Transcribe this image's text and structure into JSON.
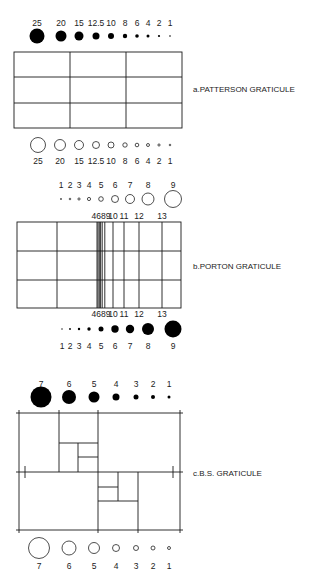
{
  "figure": {
    "patterson": {
      "caption": "a.PATTERSON GRATICULE",
      "filled_circles": {
        "labels": [
          "25",
          "20",
          "15",
          "12.5",
          "10",
          "8",
          "6",
          "4",
          "2",
          "1"
        ],
        "cx": [
          37,
          61,
          79,
          96,
          111,
          125,
          137,
          148,
          159,
          170
        ],
        "r": [
          7.5,
          5.5,
          4.5,
          3.5,
          3,
          2.2,
          1.8,
          1.5,
          1.1,
          0.8
        ],
        "label_y": 23,
        "cy": 36
      },
      "grid": {
        "x0": 14,
        "y0": 52,
        "x1": 182,
        "y1": 128,
        "vlines": [
          70,
          126
        ],
        "hlines": [
          77,
          103
        ]
      },
      "open_circles": {
        "labels": [
          "25",
          "20",
          "15",
          "12.5",
          "10",
          "8",
          "6",
          "4",
          "2",
          "1"
        ],
        "cx": [
          38,
          60,
          79,
          96,
          111,
          125,
          137,
          148,
          159,
          170
        ],
        "r": [
          7.5,
          5.5,
          4.5,
          3.5,
          3,
          2.2,
          1.8,
          1.5,
          1.1,
          0.8
        ],
        "cy": 145,
        "label_y": 161
      }
    },
    "porton": {
      "caption": "b.PORTON  GRATICULE",
      "open_circles": {
        "labels": [
          "1",
          "2",
          "3",
          "4",
          "5",
          "6",
          "7",
          "8",
          "9"
        ],
        "cx": [
          61,
          70,
          79,
          89,
          101,
          115,
          130,
          148,
          173
        ],
        "r": [
          0.6,
          0.8,
          1.1,
          1.6,
          2.3,
          3.5,
          4.5,
          6,
          8.5
        ],
        "label_y": 185,
        "cy": 199
      },
      "grid_labels": [
        "4689",
        "10",
        "11",
        "12",
        "13"
      ],
      "grid_label_x": [
        101,
        113,
        124,
        139,
        162
      ],
      "grid_label_top_y": 219,
      "grid_label_bottom_y": 317,
      "grid": {
        "x0": 17,
        "y0": 222,
        "x1": 181,
        "y1": 308,
        "vlines": [
          57,
          97,
          98,
          99.3,
          100.6,
          102.2,
          104.8,
          113,
          124,
          139,
          162
        ],
        "hlines": [
          251,
          280
        ]
      },
      "filled_circles": {
        "labels": [
          "1",
          "2",
          "3",
          "4",
          "5",
          "6",
          "7",
          "8",
          "9"
        ],
        "cx": [
          62,
          70,
          79,
          89,
          101,
          115,
          130,
          148,
          173
        ],
        "r": [
          0.7,
          0.9,
          1.2,
          1.7,
          2.5,
          3.7,
          4.2,
          6,
          8.5
        ],
        "cy": 329,
        "label_y": 346
      }
    },
    "bs": {
      "caption": "c.B.S. GRATICULE",
      "filled_circles": {
        "labels": [
          "7",
          "6",
          "5",
          "4",
          "3",
          "2",
          "1"
        ],
        "cx": [
          41,
          69,
          94,
          116,
          136,
          153,
          169
        ],
        "r": [
          10.5,
          7,
          5.5,
          3.5,
          2.5,
          2,
          1.5
        ],
        "label_y": 384,
        "cy": 397
      },
      "outer": {
        "x0": 19,
        "y0": 413,
        "x1": 180,
        "y1": 530
      },
      "mid_y": 472,
      "open_circles": {
        "labels": [
          "7",
          "6",
          "5",
          "4",
          "3",
          "2",
          "1"
        ],
        "cx": [
          39,
          69,
          94,
          116,
          136,
          153,
          169
        ],
        "r": [
          10.5,
          7,
          5.5,
          3.5,
          2.5,
          2,
          1.5
        ],
        "cy": 548,
        "label_y": 566
      }
    }
  }
}
